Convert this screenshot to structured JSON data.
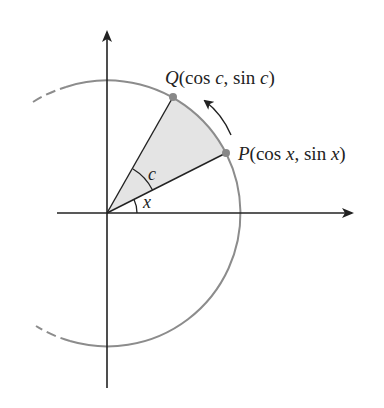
{
  "figure": {
    "type": "unit-circle-sector",
    "colors": {
      "axis": "#222222",
      "circle": "#8a8a8a",
      "point": "#8a8a8a",
      "sector_fill": "#e2e2e2",
      "radius_line": "#222222"
    },
    "points": {
      "Q": {
        "name": "Q",
        "open": "(",
        "coord1": "cos ",
        "var1": "c",
        "sep": ", sin ",
        "var2": "c",
        "close": ")"
      },
      "P": {
        "name": "P",
        "open": "(",
        "coord1": "cos ",
        "var1": "x",
        "sep": ", sin ",
        "var2": "x",
        "close": ")"
      }
    },
    "angles": {
      "x_label": "x",
      "c_label": "c"
    }
  }
}
